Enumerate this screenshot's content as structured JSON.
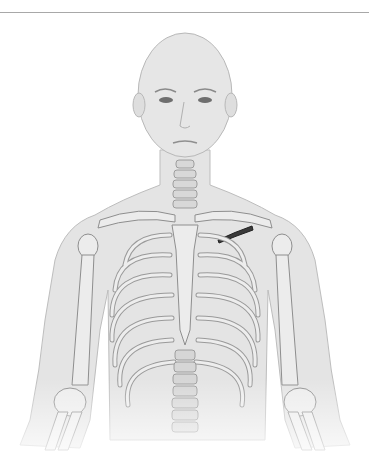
{
  "figure": {
    "highlight": {
      "label": "left clavicle highlight",
      "color": "#3a3a3a"
    },
    "colors": {
      "skin": "#e2e2e2",
      "skin_edge": "#bdbdbd",
      "bone": "#ededed",
      "bone_edge": "#8e8e8e",
      "rule": "#a8a8a8"
    }
  }
}
